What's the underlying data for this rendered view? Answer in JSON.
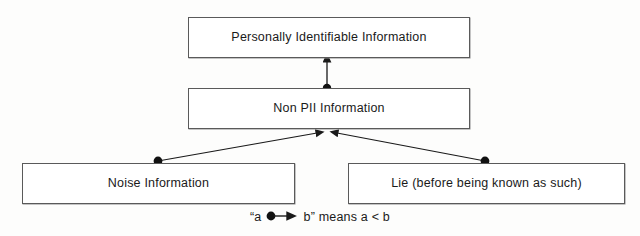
{
  "diagram": {
    "type": "class-hierarchy",
    "title": "",
    "notation": "filled-dot-at-source, solid-arrowhead-at-target",
    "nodes": [
      {
        "id": "pii",
        "label": "Personally Identifiable Information"
      },
      {
        "id": "nonpii",
        "label": "Non PII Information"
      },
      {
        "id": "noise",
        "label": "Noise Information"
      },
      {
        "id": "lie",
        "label": "Lie (before being known as such)"
      }
    ],
    "edges": [
      {
        "from": "nonpii",
        "to": "pii"
      },
      {
        "from": "noise",
        "to": "nonpii"
      },
      {
        "from": "lie",
        "to": "nonpii"
      }
    ]
  },
  "legend": {
    "prefix": "“a",
    "suffix": "b” means a < b",
    "dot_name": "source-dot",
    "arrow_name": "target-arrowhead"
  },
  "colors": {
    "ink": "#1a1a1a",
    "border": "#5a5a5a",
    "background": "#fdfdfc"
  }
}
